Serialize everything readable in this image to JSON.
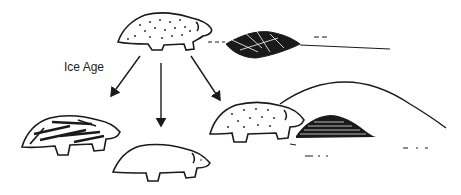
{
  "diagram": {
    "type": "evolution-branching",
    "labels": {
      "event": "Ice Age"
    },
    "nodes": [
      {
        "id": "ancestor",
        "description": "speckled ancestor animal",
        "position": "top-center"
      },
      {
        "id": "striped",
        "description": "striped descendant",
        "position": "bottom-left"
      },
      {
        "id": "plain",
        "description": "plain white descendant",
        "position": "bottom-center"
      },
      {
        "id": "speckled",
        "description": "speckled descendant near burrow",
        "position": "bottom-right"
      }
    ],
    "edges": [
      {
        "from": "ancestor",
        "to": "striped"
      },
      {
        "from": "ancestor",
        "to": "plain"
      },
      {
        "from": "ancestor",
        "to": "speckled"
      }
    ],
    "scenery": [
      "brush-pile",
      "hill",
      "burrow-mound"
    ],
    "colors": {
      "ink": "#1a1a1a",
      "background": "#ffffff"
    }
  }
}
